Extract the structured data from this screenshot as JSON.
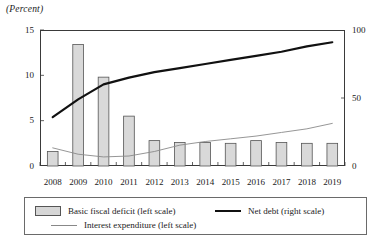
{
  "figure": {
    "unit_label": "(Percent)"
  },
  "axes": {
    "left_ticks": [
      "15",
      "10",
      "5",
      "0"
    ],
    "left_values": [
      15,
      10,
      5,
      0
    ],
    "right_ticks": [
      "100",
      "50",
      "0"
    ],
    "right_values": [
      100,
      50,
      0
    ],
    "left_range": [
      0,
      15
    ],
    "right_range": [
      0,
      100
    ]
  },
  "legend": {
    "bar_label": "Basic fiscal deficit (left scale)",
    "thick_line_label": "Net debt (right scale)",
    "thin_line_label": "Interest expenditure (left scale)"
  },
  "colors": {
    "bar_fill": "#d9d9d9",
    "bar_stroke": "#555555",
    "net_debt_line": "#111111",
    "interest_line": "#8a8a8a",
    "frame": "#3a3a3a"
  },
  "chart_data": {
    "type": "bar",
    "title": "",
    "subtitle": "",
    "xlabel": "",
    "ylabel": "(Percent)",
    "y2label": "(Percent)",
    "ylim": [
      0,
      15
    ],
    "y2lim": [
      0,
      100
    ],
    "grid": false,
    "legend_position": "bottom",
    "categories": [
      "2008",
      "2009",
      "2010",
      "2011",
      "2012",
      "2013",
      "2014",
      "2015",
      "2016",
      "2017",
      "2018",
      "2019"
    ],
    "series": [
      {
        "name": "Basic fiscal deficit (left scale)",
        "type": "bar",
        "axis": "left",
        "values": [
          1.6,
          13.4,
          9.8,
          5.5,
          2.8,
          2.6,
          2.6,
          2.5,
          2.8,
          2.6,
          2.5,
          2.5
        ]
      },
      {
        "name": "Net debt (right scale)",
        "type": "line",
        "axis": "right",
        "values": [
          36,
          49,
          60,
          65,
          69,
          72,
          75,
          78,
          81,
          84,
          88,
          91
        ]
      },
      {
        "name": "Interest expenditure (left scale)",
        "type": "line",
        "axis": "left",
        "values": [
          2.0,
          1.3,
          1.0,
          1.1,
          1.6,
          2.3,
          2.7,
          3.0,
          3.3,
          3.7,
          4.1,
          4.7
        ]
      }
    ]
  }
}
